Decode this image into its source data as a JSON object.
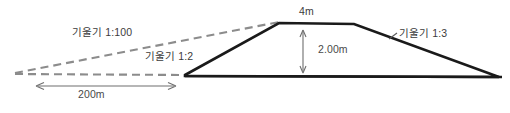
{
  "diagram": {
    "colors": {
      "outline": "#1a1a1a",
      "dashed": "#8c8c8c",
      "dimension": "#6e6e6e",
      "text": "#3b3b3b",
      "background": "#ffffff"
    },
    "labels": {
      "slope_left_flat": "기울기 1:100",
      "slope_left_steep": "기울기 1:2",
      "slope_right": "기울기 1:3",
      "crest_width": "4m",
      "height": "2.00m",
      "base_length": "200m"
    },
    "geometry": {
      "left_apex": [
        15,
        73
      ],
      "left_toe": [
        185,
        75
      ],
      "crest_left": [
        279,
        23
      ],
      "crest_right": [
        354,
        24
      ],
      "right_toe": [
        499,
        77
      ],
      "ground_line_y": 76,
      "dim_200m_line_y": 86,
      "dim_200m_x_start": 36,
      "dim_200m_x_end": 176,
      "dim_height_x": 303,
      "dim_height_y_top": 30,
      "dim_height_y_bottom": 73
    }
  }
}
